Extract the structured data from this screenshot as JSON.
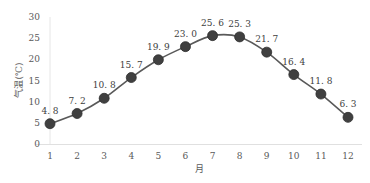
{
  "chart_data": {
    "type": "line",
    "title": "",
    "xlabel": "月",
    "ylabel": "气温(℃)",
    "categories": [
      "1",
      "2",
      "3",
      "4",
      "5",
      "6",
      "7",
      "8",
      "9",
      "10",
      "11",
      "12"
    ],
    "series": [
      {
        "name": "气温",
        "values": [
          4.8,
          7.2,
          10.8,
          15.7,
          19.9,
          23.0,
          25.6,
          25.3,
          21.7,
          16.4,
          11.8,
          6.3
        ],
        "labels": [
          "4.8",
          "7.2",
          "10.8",
          "15.7",
          "19.9",
          "23.0",
          "25.6",
          "25.3",
          "21.7",
          "16.4",
          "11.8",
          "6.3"
        ],
        "line_color": "#595959",
        "marker_color": "#404040",
        "smooth": true
      }
    ],
    "ylim": [
      0,
      30
    ],
    "yticks": [
      "0",
      "5",
      "10",
      "15",
      "20",
      "25",
      "30"
    ],
    "grid": false,
    "legend": "none"
  }
}
